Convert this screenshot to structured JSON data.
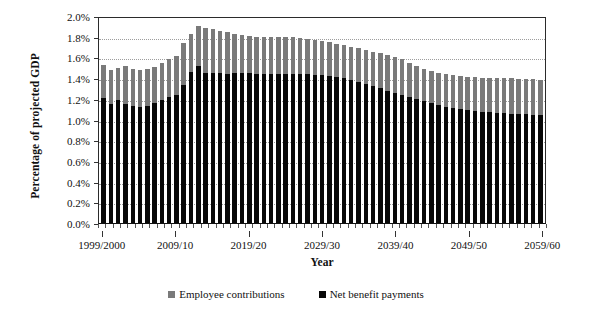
{
  "chart_data": {
    "type": "bar",
    "title": "",
    "subtitle": "",
    "xlabel": "Year",
    "ylabel": "Percentage of projected GDP",
    "ylim": [
      0.0,
      2.0
    ],
    "ytick_values": [
      0.0,
      0.2,
      0.4,
      0.6,
      0.8,
      1.0,
      1.2,
      1.4,
      1.6,
      1.8,
      2.0
    ],
    "ytick_labels": [
      "0.0%",
      "0.2%",
      "0.4%",
      "0.6%",
      "0.8%",
      "1.0%",
      "1.2%",
      "1.4%",
      "1.6%",
      "1.8%",
      "2.0%"
    ],
    "grid": "horizontal-dotted",
    "stacked": false,
    "overlaid": true,
    "legend_position": "bottom-center",
    "legend": [
      "Employee contributions",
      "Net benefit payments"
    ],
    "colors": {
      "employee_contributions": "#7a7a7a",
      "net_benefit_payments": "#080808"
    },
    "categories": [
      "1999/2000",
      "2000/01",
      "2001/02",
      "2002/03",
      "2003/04",
      "2004/05",
      "2005/06",
      "2006/07",
      "2007/08",
      "2008/09",
      "2009/10",
      "2010/11",
      "2011/12",
      "2012/13",
      "2013/14",
      "2014/15",
      "2015/16",
      "2016/17",
      "2017/18",
      "2018/19",
      "2019/20",
      "2020/21",
      "2021/22",
      "2022/23",
      "2023/24",
      "2024/25",
      "2025/26",
      "2026/27",
      "2027/28",
      "2028/29",
      "2029/30",
      "2030/31",
      "2031/32",
      "2032/33",
      "2033/34",
      "2034/35",
      "2035/36",
      "2036/37",
      "2037/38",
      "2038/39",
      "2039/40",
      "2040/41",
      "2041/42",
      "2042/43",
      "2043/44",
      "2044/45",
      "2045/46",
      "2046/47",
      "2047/48",
      "2048/49",
      "2049/50",
      "2050/51",
      "2051/52",
      "2052/53",
      "2053/54",
      "2054/55",
      "2055/56",
      "2056/57",
      "2057/58",
      "2058/59",
      "2059/60"
    ],
    "xtick_labels": [
      "1999/2000",
      "2009/10",
      "2019/20",
      "2029/30",
      "2039/40",
      "2049/50",
      "2059/60"
    ],
    "xtick_indices": [
      0,
      10,
      20,
      30,
      40,
      50,
      60
    ],
    "series": [
      {
        "name": "Employee contributions",
        "color": "#7a7a7a",
        "values": [
          1.53,
          1.48,
          1.5,
          1.52,
          1.49,
          1.48,
          1.49,
          1.51,
          1.55,
          1.58,
          1.61,
          1.74,
          1.83,
          1.9,
          1.88,
          1.87,
          1.86,
          1.85,
          1.83,
          1.82,
          1.81,
          1.8,
          1.8,
          1.8,
          1.8,
          1.8,
          1.8,
          1.79,
          1.78,
          1.77,
          1.76,
          1.75,
          1.73,
          1.72,
          1.7,
          1.69,
          1.67,
          1.65,
          1.64,
          1.62,
          1.6,
          1.58,
          1.55,
          1.52,
          1.49,
          1.47,
          1.45,
          1.44,
          1.43,
          1.42,
          1.41,
          1.41,
          1.4,
          1.4,
          1.4,
          1.4,
          1.4,
          1.39,
          1.39,
          1.39,
          1.38
        ]
      },
      {
        "name": "Net benefit payments",
        "color": "#080808",
        "values": [
          1.21,
          1.15,
          1.19,
          1.15,
          1.13,
          1.12,
          1.13,
          1.16,
          1.19,
          1.22,
          1.24,
          1.33,
          1.46,
          1.52,
          1.45,
          1.45,
          1.45,
          1.44,
          1.45,
          1.45,
          1.45,
          1.44,
          1.44,
          1.44,
          1.44,
          1.44,
          1.44,
          1.44,
          1.44,
          1.43,
          1.43,
          1.42,
          1.41,
          1.4,
          1.38,
          1.36,
          1.34,
          1.32,
          1.3,
          1.28,
          1.26,
          1.24,
          1.22,
          1.2,
          1.18,
          1.16,
          1.14,
          1.12,
          1.11,
          1.1,
          1.09,
          1.08,
          1.07,
          1.07,
          1.06,
          1.06,
          1.05,
          1.05,
          1.05,
          1.04,
          1.04
        ]
      }
    ]
  },
  "legend": {
    "employee_contributions": "Employee contributions",
    "net_benefit_payments": "Net benefit payments"
  }
}
